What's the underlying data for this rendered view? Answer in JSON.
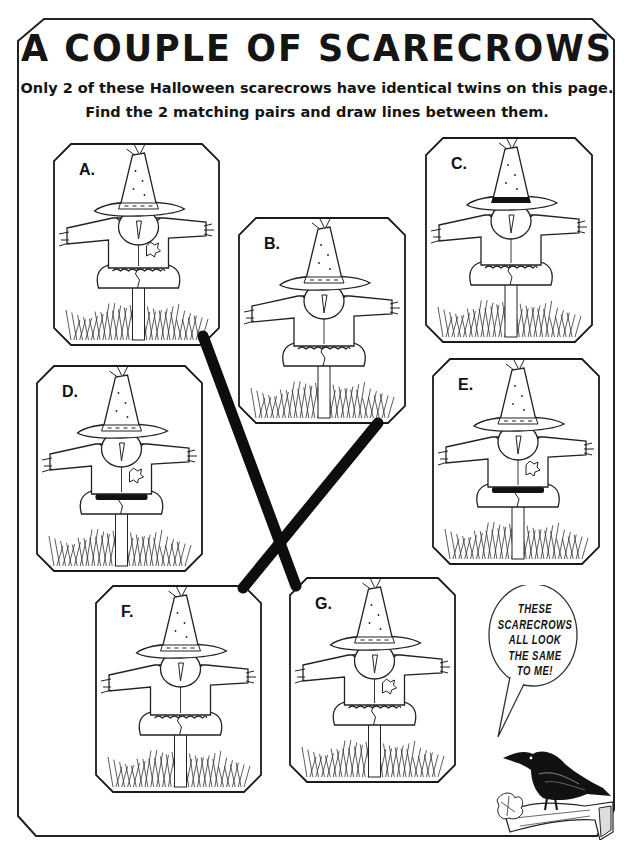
{
  "title": "A COUPLE OF SCARECROWS",
  "instructions": {
    "line1": "Only 2 of these Halloween scarecrows have identical twins on this page.",
    "line2": "Find the 2 matching pairs and draw lines between them."
  },
  "panels": [
    {
      "id": "A",
      "label": "A.",
      "x": 53,
      "y": 143,
      "w": 167,
      "h": 203,
      "hat_band": "dotted",
      "belt": "rope",
      "patch": true
    },
    {
      "id": "B",
      "label": "B.",
      "x": 238,
      "y": 217,
      "w": 168,
      "h": 207,
      "hat_band": "dotted",
      "belt": "rope",
      "patch": false
    },
    {
      "id": "C",
      "label": "C.",
      "x": 425,
      "y": 137,
      "w": 168,
      "h": 206,
      "hat_band": "solid",
      "belt": "rope",
      "patch": false
    },
    {
      "id": "D",
      "label": "D.",
      "x": 36,
      "y": 365,
      "w": 167,
      "h": 207,
      "hat_band": "dotted",
      "belt": "solid",
      "patch": true
    },
    {
      "id": "E",
      "label": "E.",
      "x": 432,
      "y": 358,
      "w": 168,
      "h": 207,
      "hat_band": "dotted",
      "belt": "solid",
      "patch": true
    },
    {
      "id": "F",
      "label": "F.",
      "x": 95,
      "y": 585,
      "w": 167,
      "h": 208,
      "hat_band": "dotted",
      "belt": "rope",
      "patch": false
    },
    {
      "id": "G",
      "label": "G.",
      "x": 289,
      "y": 577,
      "w": 167,
      "h": 206,
      "hat_band": "dotted",
      "belt": "rope",
      "patch": true
    }
  ],
  "drawn_lines": [
    {
      "from": "A",
      "to": "G",
      "x1": 203,
      "y1": 336,
      "x2": 296,
      "y2": 586
    },
    {
      "from": "B",
      "to": "F",
      "x1": 378,
      "y1": 423,
      "x2": 243,
      "y2": 588
    }
  ],
  "speech_bubble": {
    "lines": [
      "THESE",
      "SCARECROWS",
      "ALL LOOK",
      "THE SAME",
      "TO ME!"
    ],
    "speaker": "crow"
  },
  "colors": {
    "ink": "#151515",
    "paper": "#ffffff",
    "marker": "#0d0d0d"
  }
}
